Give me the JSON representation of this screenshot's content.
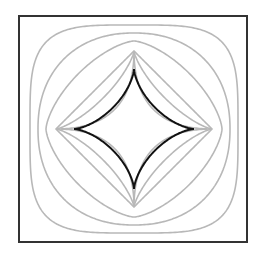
{
  "figure": {
    "frame": {
      "x": 19,
      "y": 16,
      "width": 228,
      "height": 226,
      "stroke": "#333333",
      "stroke_width": 2
    },
    "center": {
      "x": 134,
      "y": 129
    },
    "highlight_curve": {
      "name": "astroid",
      "exponent": 0.6667,
      "radius": 60,
      "stroke": "#111111",
      "stroke_width": 2
    },
    "family_curves": [
      {
        "exponent": 0.5,
        "radius": 78
      },
      {
        "exponent": 0.75,
        "radius": 78
      },
      {
        "exponent": 1.0,
        "radius": 78
      },
      {
        "exponent": 1.5,
        "radius": 88
      },
      {
        "exponent": 2.2,
        "radius": 96
      },
      {
        "exponent": 4.0,
        "radius": 104
      }
    ],
    "family_stroke": "#b8b8b8",
    "family_stroke_width": 1.6
  }
}
